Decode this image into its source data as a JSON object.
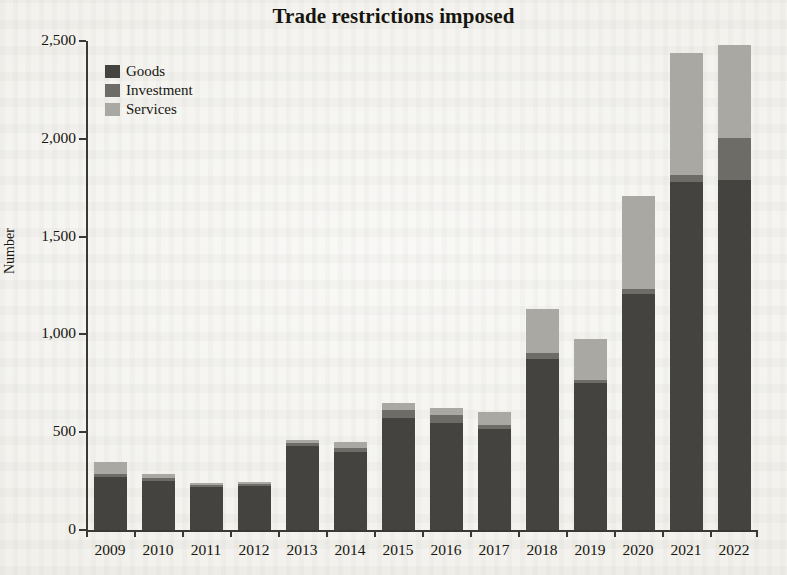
{
  "chart_data": {
    "type": "bar",
    "title": "Trade restrictions imposed",
    "xlabel": "",
    "ylabel": "Number",
    "stacked": true,
    "grid": false,
    "legend_position": "top-left",
    "ylim": [
      0,
      2500
    ],
    "ytick_labels": [
      "0",
      "500",
      "1,000",
      "1,500",
      "2,000",
      "2,500"
    ],
    "ytick_values": [
      0,
      500,
      1000,
      1500,
      2000,
      2500
    ],
    "categories": [
      "2009",
      "2010",
      "2011",
      "2012",
      "2013",
      "2014",
      "2015",
      "2016",
      "2017",
      "2018",
      "2019",
      "2020",
      "2021",
      "2022"
    ],
    "series": [
      {
        "name": "Goods",
        "color": "#45433f",
        "values": [
          270,
          250,
          220,
          225,
          430,
          400,
          575,
          545,
          515,
          875,
          750,
          1205,
          1780,
          1790
        ]
      },
      {
        "name": "Investment",
        "color": "#6e6c67",
        "values": [
          15,
          15,
          10,
          10,
          15,
          20,
          40,
          45,
          20,
          30,
          15,
          25,
          35,
          215
        ]
      },
      {
        "name": "Services",
        "color": "#aaa8a3",
        "values": [
          65,
          20,
          10,
          10,
          15,
          30,
          35,
          35,
          70,
          225,
          210,
          480,
          625,
          475
        ]
      }
    ],
    "totals": [
      350,
      285,
      240,
      245,
      460,
      450,
      650,
      625,
      605,
      1130,
      975,
      1710,
      2440,
      2480
    ]
  },
  "legend": {
    "items": [
      {
        "label": "Goods",
        "color": "#45433f"
      },
      {
        "label": "Investment",
        "color": "#6e6c67"
      },
      {
        "label": "Services",
        "color": "#aaa8a3"
      }
    ]
  }
}
